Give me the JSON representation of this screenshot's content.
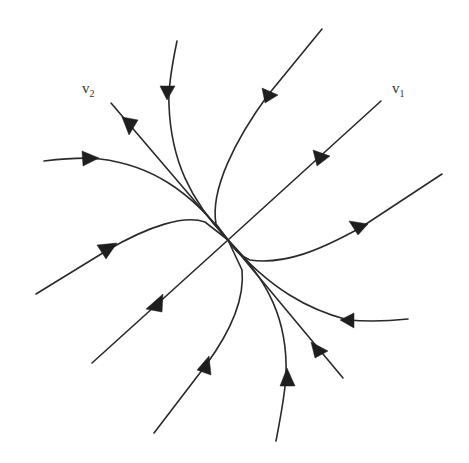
{
  "diagram": {
    "type": "phase-portrait",
    "center": [
      228,
      240
    ],
    "labels": {
      "v1": {
        "base": "v",
        "sub": "1",
        "x": 392,
        "y": 88
      },
      "v2": {
        "base": "v",
        "sub": "2",
        "x": 82,
        "y": 90
      }
    },
    "eigen_lines": [
      {
        "name": "v1",
        "direction": "upper-right to lower-left"
      },
      {
        "name": "v2",
        "direction": "upper-left to lower-right"
      }
    ],
    "trajectory_count": 12,
    "colors": {
      "stroke": "#2a2a2a",
      "background": "#ffffff"
    }
  }
}
